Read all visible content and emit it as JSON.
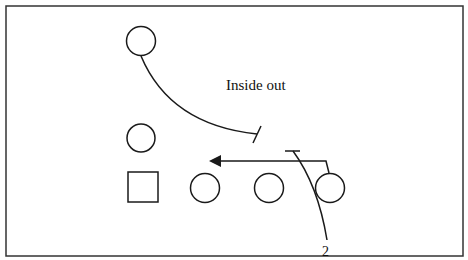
{
  "diagram": {
    "title": "Inside out",
    "route_label": "2",
    "colors": {
      "stroke": "#1a1a1a",
      "background": "#ffffff",
      "border": "#333333"
    },
    "players": [
      {
        "id": "top-receiver",
        "shape": "circle"
      },
      {
        "id": "slot-receiver",
        "shape": "circle"
      },
      {
        "id": "center",
        "shape": "square"
      },
      {
        "id": "lineman-1",
        "shape": "circle"
      },
      {
        "id": "lineman-2",
        "shape": "circle"
      },
      {
        "id": "lineman-3",
        "shape": "circle"
      }
    ],
    "routes": [
      {
        "id": "curved-block-route",
        "end": "block-t"
      },
      {
        "id": "pull-arrow",
        "end": "arrow"
      },
      {
        "id": "route-2",
        "end": "block-t"
      }
    ]
  }
}
